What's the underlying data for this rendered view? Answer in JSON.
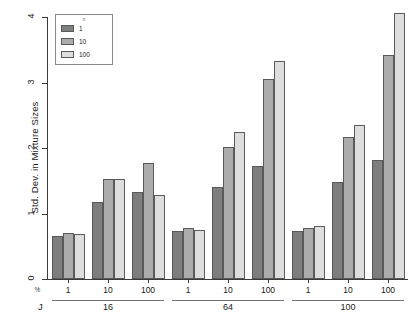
{
  "chart_data": {
    "type": "bar",
    "title": "",
    "xlabel": "J",
    "ylabel": "Std. Dev. in Mixture Sizes",
    "ylim": [
      0,
      4
    ],
    "yticks": [
      0,
      1,
      2,
      3,
      4
    ],
    "ytick_labels": [
      "0",
      "1",
      "2",
      "3",
      "4"
    ],
    "grid": false,
    "legend_position": "top-left",
    "legend_title": "n",
    "legend_entries": [
      "1",
      "10",
      "100"
    ],
    "series_colors": [
      "#7e7e7e",
      "#acacac",
      "#dedede"
    ],
    "outer_group_variable": "J",
    "outer_groups": [
      "16",
      "64",
      "100"
    ],
    "inner_group_variable": "%",
    "inner_groups": [
      "1",
      "10",
      "100"
    ],
    "series": [
      {
        "name": "1",
        "values": [
          0.66,
          1.17,
          1.33,
          0.73,
          1.41,
          1.72,
          0.74,
          1.48,
          1.82
        ]
      },
      {
        "name": "10",
        "values": [
          0.71,
          1.53,
          1.77,
          0.78,
          2.01,
          3.05,
          0.78,
          2.17,
          3.42
        ]
      },
      {
        "name": "100",
        "values": [
          0.68,
          1.53,
          1.29,
          0.75,
          2.25,
          3.33,
          0.81,
          2.35,
          4.06
        ]
      }
    ],
    "bars": [
      {
        "J": "16",
        "pct": "1",
        "n": "1",
        "value": 0.66
      },
      {
        "J": "16",
        "pct": "1",
        "n": "10",
        "value": 0.71
      },
      {
        "J": "16",
        "pct": "1",
        "n": "100",
        "value": 0.68
      },
      {
        "J": "16",
        "pct": "10",
        "n": "1",
        "value": 1.17
      },
      {
        "J": "16",
        "pct": "10",
        "n": "10",
        "value": 1.53
      },
      {
        "J": "16",
        "pct": "10",
        "n": "100",
        "value": 1.53
      },
      {
        "J": "16",
        "pct": "100",
        "n": "1",
        "value": 1.33
      },
      {
        "J": "16",
        "pct": "100",
        "n": "10",
        "value": 1.77
      },
      {
        "J": "16",
        "pct": "100",
        "n": "100",
        "value": 1.29
      },
      {
        "J": "64",
        "pct": "1",
        "n": "1",
        "value": 0.73
      },
      {
        "J": "64",
        "pct": "1",
        "n": "10",
        "value": 0.78
      },
      {
        "J": "64",
        "pct": "1",
        "n": "100",
        "value": 0.75
      },
      {
        "J": "64",
        "pct": "10",
        "n": "1",
        "value": 1.41
      },
      {
        "J": "64",
        "pct": "10",
        "n": "10",
        "value": 2.01
      },
      {
        "J": "64",
        "pct": "10",
        "n": "100",
        "value": 2.25
      },
      {
        "J": "64",
        "pct": "100",
        "n": "1",
        "value": 1.72
      },
      {
        "J": "64",
        "pct": "100",
        "n": "10",
        "value": 3.05
      },
      {
        "J": "64",
        "pct": "100",
        "n": "100",
        "value": 3.33
      },
      {
        "J": "100",
        "pct": "1",
        "n": "1",
        "value": 0.74
      },
      {
        "J": "100",
        "pct": "1",
        "n": "10",
        "value": 0.78
      },
      {
        "J": "100",
        "pct": "1",
        "n": "100",
        "value": 0.81
      },
      {
        "J": "100",
        "pct": "10",
        "n": "1",
        "value": 1.48
      },
      {
        "J": "100",
        "pct": "10",
        "n": "10",
        "value": 2.17
      },
      {
        "J": "100",
        "pct": "10",
        "n": "100",
        "value": 2.35
      },
      {
        "J": "100",
        "pct": "100",
        "n": "1",
        "value": 1.82
      },
      {
        "J": "100",
        "pct": "100",
        "n": "10",
        "value": 3.42
      },
      {
        "J": "100",
        "pct": "100",
        "n": "100",
        "value": 4.06
      }
    ]
  }
}
